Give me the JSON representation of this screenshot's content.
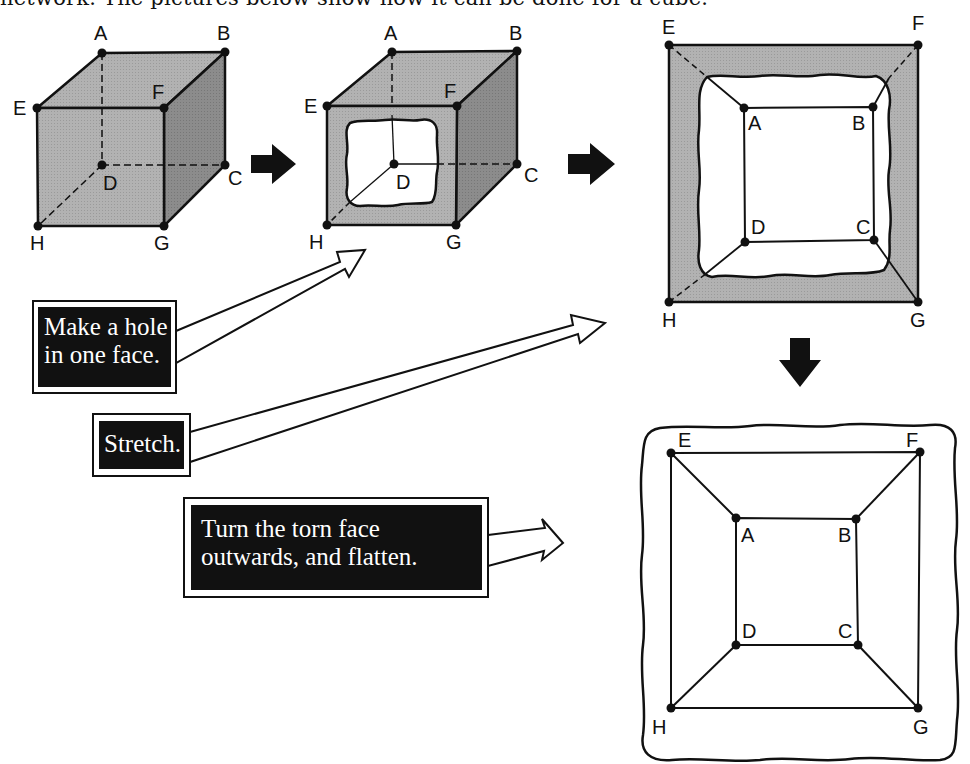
{
  "header": {
    "text": "network. The pictures below show how it can be done for a cube."
  },
  "steps": [
    {
      "id": "cube",
      "description": "Original cube",
      "vertices": {
        "A": "A",
        "B": "B",
        "C": "C",
        "D": "D",
        "E": "E",
        "F": "F",
        "G": "G",
        "H": "H"
      }
    },
    {
      "id": "cube-with-hole",
      "description": "Cube with hole in front face",
      "vertices": {
        "A": "A",
        "B": "B",
        "C": "C",
        "D": "D",
        "E": "E",
        "F": "F",
        "G": "G",
        "H": "H"
      }
    },
    {
      "id": "stretched",
      "description": "Stretched through the hole",
      "vertices": {
        "A": "A",
        "B": "B",
        "C": "C",
        "D": "D",
        "E": "E",
        "F": "F",
        "G": "G",
        "H": "H"
      }
    },
    {
      "id": "flattened",
      "description": "Flattened network (planar graph)",
      "vertices": {
        "A": "A",
        "B": "B",
        "C": "C",
        "D": "D",
        "E": "E",
        "F": "F",
        "G": "G",
        "H": "H"
      }
    }
  ],
  "callouts": [
    {
      "id": "make-hole",
      "lines": [
        "Make a hole",
        "in one face."
      ]
    },
    {
      "id": "stretch",
      "lines": [
        "Stretch."
      ]
    },
    {
      "id": "turn-flatten",
      "lines": [
        "Turn the torn face",
        "outwards, and flatten."
      ]
    }
  ],
  "colors": {
    "face_light": "#b4b4b4",
    "face_top": "#a8a8a8",
    "face_side": "#8a8a8a",
    "ink": "#111111",
    "callout_bg": "#111111",
    "callout_text": "#ffffff"
  }
}
